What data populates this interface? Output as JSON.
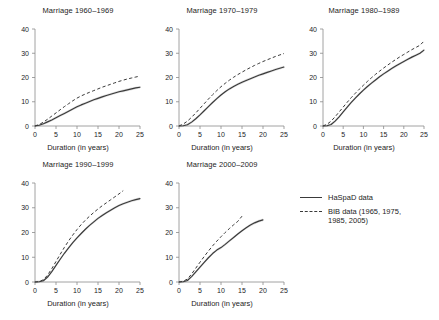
{
  "figure": {
    "width": 439,
    "height": 320,
    "background": "#ffffff",
    "line_color": "#3a3a3a",
    "axis_color": "#8a8a8a",
    "band_color": "#b4b4b4"
  },
  "legend": {
    "position": "right-middle",
    "entries": [
      {
        "style": "solid",
        "label": "HaSpaD data"
      },
      {
        "style": "dashed",
        "label": "BIB data (1965, 1975,\n1985, 2005)"
      }
    ]
  },
  "chart_data": [
    {
      "type": "line",
      "title": "Marriage 1960–1969",
      "xlabel": "Duration (in years)",
      "ylabel": "",
      "xlim": [
        0,
        25
      ],
      "ylim": [
        0,
        40
      ],
      "xticks": [
        0,
        5,
        10,
        15,
        20,
        25
      ],
      "yticks": [
        0,
        10,
        20,
        30,
        40
      ],
      "grid": false,
      "series": [
        {
          "name": "HaSpaD data",
          "style": "solid",
          "x": [
            0,
            1,
            2,
            3,
            4,
            5,
            6,
            7,
            8,
            9,
            10,
            11,
            12,
            13,
            14,
            15,
            16,
            17,
            18,
            19,
            20,
            21,
            22,
            23,
            24,
            25
          ],
          "values": [
            0,
            0.3,
            0.9,
            1.7,
            2.5,
            3.4,
            4.3,
            5.2,
            6.1,
            7.0,
            7.9,
            8.7,
            9.4,
            10.1,
            10.8,
            11.4,
            12.0,
            12.6,
            13.1,
            13.6,
            14.1,
            14.5,
            14.9,
            15.3,
            15.7,
            16.0
          ]
        },
        {
          "name": "BIB data (1965, 1975, 1985, 2005)",
          "style": "dashed",
          "x": [
            0,
            1,
            2,
            3,
            4,
            5,
            6,
            7,
            8,
            9,
            10,
            11,
            12,
            13,
            14,
            15,
            16,
            17,
            18,
            19,
            20,
            21,
            22,
            23,
            24,
            25
          ],
          "values": [
            0,
            0.6,
            1.6,
            2.8,
            4.1,
            5.4,
            6.7,
            8.0,
            9.2,
            10.4,
            11.5,
            12.4,
            13.2,
            13.9,
            14.6,
            15.3,
            16.0,
            16.6,
            17.2,
            17.8,
            18.4,
            18.9,
            19.4,
            19.8,
            20.2,
            20.6
          ]
        }
      ]
    },
    {
      "type": "line",
      "title": "Marriage 1970–1979",
      "xlabel": "Duration (in years)",
      "ylabel": "",
      "xlim": [
        0,
        25
      ],
      "ylim": [
        0,
        40
      ],
      "xticks": [
        0,
        5,
        10,
        15,
        20,
        25
      ],
      "yticks": [
        0,
        10,
        20,
        30,
        40
      ],
      "grid": false,
      "series": [
        {
          "name": "HaSpaD data",
          "style": "solid",
          "x": [
            0,
            1,
            2,
            3,
            4,
            5,
            6,
            7,
            8,
            9,
            10,
            11,
            12,
            13,
            14,
            15,
            16,
            17,
            18,
            19,
            20,
            21,
            22,
            23,
            24,
            25
          ],
          "values": [
            0,
            0.1,
            0.5,
            1.6,
            3.0,
            4.6,
            6.3,
            8.0,
            9.7,
            11.3,
            12.8,
            14.1,
            15.3,
            16.3,
            17.2,
            18.0,
            18.8,
            19.5,
            20.2,
            20.9,
            21.5,
            22.1,
            22.7,
            23.3,
            23.8,
            24.3
          ]
        },
        {
          "name": "BIB data (1965, 1975, 1985, 2005)",
          "style": "dashed",
          "x": [
            0,
            1,
            2,
            3,
            4,
            5,
            6,
            7,
            8,
            9,
            10,
            11,
            12,
            13,
            14,
            15,
            16,
            17,
            18,
            19,
            20,
            21,
            22,
            23,
            24,
            25
          ],
          "values": [
            0,
            0.8,
            2.0,
            3.6,
            5.4,
            7.3,
            9.2,
            11.1,
            12.9,
            14.6,
            16.2,
            17.6,
            18.9,
            20.1,
            21.2,
            22.2,
            23.2,
            24.1,
            25.0,
            25.8,
            26.6,
            27.3,
            28.0,
            28.7,
            29.3,
            29.9
          ]
        }
      ]
    },
    {
      "type": "line",
      "title": "Marriage 1980–1989",
      "xlabel": "Duration (in years)",
      "ylabel": "",
      "xlim": [
        0,
        25
      ],
      "ylim": [
        0,
        40
      ],
      "xticks": [
        0,
        5,
        10,
        15,
        20,
        25
      ],
      "yticks": [
        0,
        10,
        20,
        30,
        40
      ],
      "grid": false,
      "series": [
        {
          "name": "HaSpaD data",
          "style": "solid",
          "x": [
            0,
            1,
            2,
            3,
            4,
            5,
            6,
            7,
            8,
            9,
            10,
            11,
            12,
            13,
            14,
            15,
            16,
            17,
            18,
            19,
            20,
            21,
            22,
            23,
            24,
            25
          ],
          "values": [
            0,
            0.1,
            0.6,
            2.0,
            3.8,
            5.8,
            7.8,
            9.7,
            11.5,
            13.2,
            14.8,
            16.3,
            17.7,
            19.0,
            20.3,
            21.5,
            22.6,
            23.7,
            24.7,
            25.7,
            26.6,
            27.5,
            28.4,
            29.2,
            30.0,
            31.3
          ]
        },
        {
          "name": "BIB data (1965, 1975, 1985, 2005)",
          "style": "dashed",
          "x": [
            0,
            1,
            2,
            3,
            4,
            5,
            6,
            7,
            8,
            9,
            10,
            11,
            12,
            13,
            14,
            15,
            16,
            17,
            18,
            19,
            20,
            21,
            22,
            23,
            24,
            25
          ],
          "values": [
            0,
            0.7,
            2.0,
            3.8,
            5.8,
            7.8,
            9.8,
            11.7,
            13.5,
            15.2,
            16.8,
            18.4,
            19.9,
            21.3,
            22.6,
            23.9,
            25.1,
            26.3,
            27.4,
            28.5,
            29.5,
            30.5,
            31.5,
            32.4,
            33.3,
            35.0
          ]
        }
      ]
    },
    {
      "type": "line",
      "title": "Marriage 1990–1999",
      "xlabel": "Duration (in years)",
      "ylabel": "",
      "xlim": [
        0,
        25
      ],
      "ylim": [
        0,
        40
      ],
      "xticks": [
        0,
        5,
        10,
        15,
        20,
        25
      ],
      "yticks": [
        0,
        10,
        20,
        30,
        40
      ],
      "grid": false,
      "series": [
        {
          "name": "HaSpaD data",
          "style": "solid",
          "x": [
            0,
            1,
            2,
            3,
            4,
            5,
            6,
            7,
            8,
            9,
            10,
            11,
            12,
            13,
            14,
            15,
            16,
            17,
            18,
            19,
            20,
            21,
            22,
            23,
            24,
            25
          ],
          "values": [
            0,
            0.1,
            0.5,
            2.0,
            4.2,
            6.7,
            9.2,
            11.6,
            13.8,
            15.9,
            17.8,
            19.6,
            21.3,
            22.9,
            24.3,
            25.7,
            26.9,
            28.0,
            29.0,
            30.0,
            30.9,
            31.6,
            32.2,
            32.8,
            33.3,
            33.7
          ]
        },
        {
          "name": "BIB data (1965, 1975, 1985, 2005)",
          "style": "dashed",
          "x": [
            0,
            1,
            2,
            3,
            4,
            5,
            6,
            7,
            8,
            9,
            10,
            11,
            12,
            13,
            14,
            15,
            16,
            17,
            18,
            19,
            20,
            21
          ],
          "values": [
            0,
            0.2,
            0.9,
            2.8,
            5.4,
            8.3,
            11.2,
            14.0,
            16.6,
            19.0,
            21.2,
            23.2,
            25.0,
            26.6,
            28.1,
            29.5,
            30.8,
            32.0,
            33.2,
            34.4,
            35.6,
            36.9
          ]
        }
      ]
    },
    {
      "type": "line",
      "title": "Marriage 2000–2009",
      "xlabel": "Duration (in years)",
      "ylabel": "",
      "xlim": [
        0,
        25
      ],
      "ylim": [
        0,
        40
      ],
      "xticks": [
        0,
        5,
        10,
        15,
        20,
        25
      ],
      "yticks": [
        0,
        10,
        20,
        30,
        40
      ],
      "grid": false,
      "series": [
        {
          "name": "HaSpaD data",
          "style": "solid",
          "x": [
            0,
            1,
            2,
            3,
            4,
            5,
            6,
            7,
            8,
            9,
            10,
            11,
            12,
            13,
            14,
            15,
            16,
            17,
            18,
            19,
            20
          ],
          "values": [
            0,
            0.1,
            0.6,
            2.2,
            4.1,
            6.0,
            7.9,
            9.8,
            11.5,
            12.9,
            13.9,
            15.2,
            16.6,
            18.0,
            19.4,
            20.7,
            21.9,
            23.0,
            23.9,
            24.6,
            25.1
          ]
        },
        {
          "name": "BIB data (1965, 1975, 1985, 2005)",
          "style": "dashed",
          "x": [
            0,
            1,
            2,
            3,
            4,
            5,
            6,
            7,
            8,
            9,
            10,
            11,
            12,
            13,
            14,
            15
          ],
          "values": [
            0,
            0.3,
            1.2,
            3.2,
            5.6,
            8.0,
            10.3,
            12.5,
            14.6,
            16.5,
            18.3,
            20.0,
            21.6,
            23.1,
            24.5,
            26.6
          ]
        }
      ]
    }
  ]
}
